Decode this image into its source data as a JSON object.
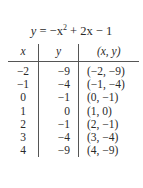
{
  "equation": {
    "lhs": "y",
    "rhs_prefix": "−x",
    "exponent": "2",
    "rhs_suffix": " + 2x − 1"
  },
  "table": {
    "headers": [
      "x",
      "y",
      "(x, y)"
    ],
    "rows": [
      [
        "−2",
        "−9",
        "(−2, −9)"
      ],
      [
        "−1",
        "−4",
        "(−1, −4)"
      ],
      [
        "0",
        "−1",
        "(0, −1)"
      ],
      [
        "1",
        "0",
        "(1, 0)"
      ],
      [
        "2",
        "−1",
        "(2, −1)"
      ],
      [
        "3",
        "−4",
        "(3, −4)"
      ],
      [
        "4",
        "−9",
        "(4, −9)"
      ]
    ]
  }
}
